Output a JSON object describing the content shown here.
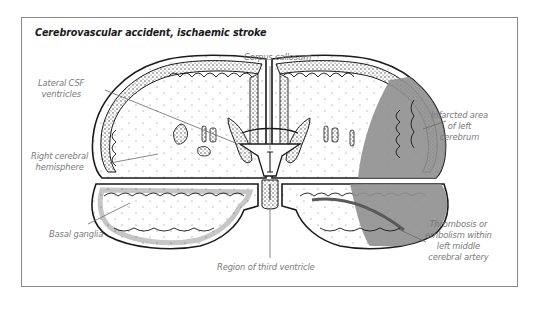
{
  "figure": {
    "title": "Cerebrovascular accident, ischaemic stroke",
    "labels": {
      "corpus_callosum": [
        "Corpus callosum"
      ],
      "lateral_csf": [
        "Lateral CSF",
        "ventricles"
      ],
      "right_hemisphere": [
        "Right cerebral",
        "hemisphere"
      ],
      "basal_ganglia": [
        "Basal ganglia"
      ],
      "third_ventricle": [
        "Region of third ventricle"
      ],
      "infarcted_area": [
        "Infarcted area",
        "of left",
        "cerebrum"
      ],
      "thrombosis": [
        "Thrombosis or",
        "embolism within",
        "left middle",
        "cerebral artery"
      ]
    },
    "colors": {
      "frame_border": "#8a8a8a",
      "outline": "#1a1a1a",
      "label_text": "#7a7a7a",
      "leader_line": "#6a6a6a",
      "infarct_shading": "#8f8f8f",
      "cortex_stipple": "#d8d8d8"
    }
  }
}
